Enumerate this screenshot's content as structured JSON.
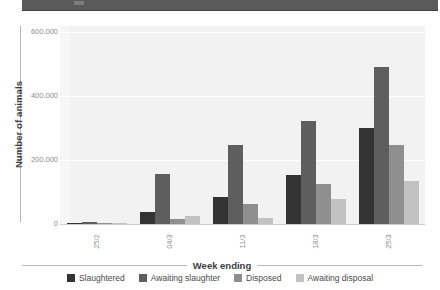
{
  "top_band": {
    "present": true,
    "color": "#5a5a5a"
  },
  "chart_data": {
    "type": "bar",
    "title": "",
    "xlabel": "Week ending",
    "ylabel": "Number of animals",
    "categories": [
      "25/2",
      "04/3",
      "11/3",
      "18/3",
      "25/3"
    ],
    "yticks": [
      "0",
      "200,000",
      "400,000",
      "600,000"
    ],
    "ytick_values": [
      0,
      200000,
      400000,
      600000
    ],
    "ylim": [
      0,
      620000
    ],
    "grid": true,
    "legend_position": "bottom",
    "series": [
      {
        "name": "Slaughtered",
        "color": "#333333",
        "values": [
          4000,
          38000,
          85000,
          152000,
          300000
        ]
      },
      {
        "name": "Awaiting slaughter",
        "color": "#5e5e5e",
        "values": [
          7000,
          158000,
          246000,
          322000,
          492000
        ]
      },
      {
        "name": "Disposed",
        "color": "#8f8f8f",
        "values": [
          2000,
          16000,
          62000,
          125000,
          246000
        ]
      },
      {
        "name": "Awaiting disposal",
        "color": "#c2c2c2",
        "values": [
          1000,
          26000,
          20000,
          78000,
          136000
        ]
      }
    ]
  }
}
